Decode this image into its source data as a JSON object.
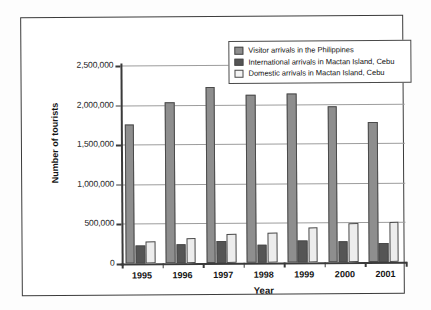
{
  "chart_data": {
    "type": "bar",
    "title": "",
    "xlabel": "Year",
    "ylabel": "Number of tourists",
    "categories": [
      "1995",
      "1996",
      "1997",
      "1998",
      "1999",
      "2000",
      "2001"
    ],
    "ylim": [
      0,
      2500000
    ],
    "ytick_labels": [
      "0",
      "500,000",
      "1,000,000",
      "1,500,000",
      "2,000,000",
      "2,500,000"
    ],
    "ytick_values": [
      0,
      500000,
      1000000,
      1500000,
      2000000,
      2500000
    ],
    "grid": "horizontal",
    "legend_position": "top-right",
    "series": [
      {
        "name": "Visitor arrivals in the Philippines",
        "color": "#8e8e8e",
        "values": [
          1760000,
          2030000,
          2220000,
          2120000,
          2140000,
          1970000,
          1770000
        ]
      },
      {
        "name": "International arrivals in Mactan Island, Cebu",
        "color": "#555555",
        "values": [
          225000,
          240000,
          275000,
          230000,
          280000,
          265000,
          240000
        ]
      },
      {
        "name": "Domestic arrivals in Mactan Island, Cebu",
        "color": "#ededed",
        "values": [
          275000,
          320000,
          370000,
          375000,
          440000,
          495000,
          510000
        ]
      }
    ]
  },
  "colors": {
    "series_visitor": "#8e8e8e",
    "series_international": "#555555",
    "series_domestic": "#ededed",
    "axis": "#3a3a3a",
    "gridline": "#9d9d9d",
    "frame": "#3b3b3b",
    "background": "#ffffff"
  }
}
